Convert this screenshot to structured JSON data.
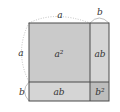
{
  "diagram": {
    "side_labels": {
      "top_a": "a",
      "top_b": "b",
      "left_a": "a",
      "left_b": "b"
    },
    "cells": {
      "a_squared": {
        "label": "a²",
        "fill": "#cacaca"
      },
      "ab_right": {
        "label": "ab",
        "fill": "#d5d5d5"
      },
      "ab_bottom": {
        "label": "ab",
        "fill": "#d5d5d5"
      },
      "b_squared": {
        "label": "b²",
        "fill": "#bdbdbd"
      }
    },
    "colors": {
      "border": "#4a4a4a",
      "arc": "#b0b0b0",
      "text": "#333333",
      "background": "#ffffff"
    }
  }
}
